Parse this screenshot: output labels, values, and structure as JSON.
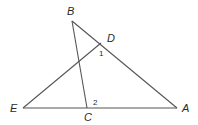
{
  "diagram": {
    "type": "geometry",
    "points": {
      "A": {
        "label": "A",
        "x": 177,
        "y": 108,
        "label_x": 185,
        "label_y": 112
      },
      "B": {
        "label": "B",
        "x": 72,
        "y": 21,
        "label_x": 67,
        "label_y": 15
      },
      "C": {
        "label": "C",
        "x": 87,
        "y": 108,
        "label_x": 84,
        "label_y": 121
      },
      "D": {
        "label": "D",
        "x": 101,
        "y": 43,
        "label_x": 107,
        "label_y": 42
      },
      "E": {
        "label": "E",
        "x": 23,
        "y": 108,
        "label_x": 10,
        "label_y": 112
      }
    },
    "segments": [
      {
        "from": "B",
        "to": "A"
      },
      {
        "from": "B",
        "to": "C"
      },
      {
        "from": "E",
        "to": "A"
      },
      {
        "from": "E",
        "to": "D"
      }
    ],
    "angle_labels": [
      {
        "label": "1",
        "x": 99,
        "y": 55
      },
      {
        "label": "2",
        "x": 93,
        "y": 105
      }
    ]
  }
}
